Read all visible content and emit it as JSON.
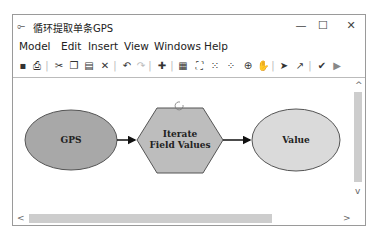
{
  "window": {
    "title": "循环提取单条GPS",
    "controls": {
      "minimize": "—",
      "maximize": "☐",
      "close": "✕"
    }
  },
  "menu": [
    "Model",
    "Edit",
    "Insert",
    "View",
    "Windows",
    "Help"
  ],
  "toolbar": [
    {
      "icon": "save-icon",
      "glyph": "▪"
    },
    {
      "icon": "print-icon",
      "glyph": "⎙"
    },
    {
      "icon": "cut-icon",
      "glyph": "✂"
    },
    {
      "icon": "copy-icon",
      "glyph": "❐"
    },
    {
      "icon": "paste-icon",
      "glyph": "▤"
    },
    {
      "icon": "delete-icon",
      "glyph": "✕"
    },
    {
      "icon": "undo-icon",
      "glyph": "↶"
    },
    {
      "icon": "redo-icon",
      "glyph": "↷"
    },
    {
      "icon": "add-data-icon",
      "glyph": "✚"
    },
    {
      "icon": "auto-layout-icon",
      "glyph": "▦"
    },
    {
      "icon": "full-extent-icon",
      "glyph": "⛶"
    },
    {
      "icon": "zoom-in-fixed-icon",
      "glyph": "⁙"
    },
    {
      "icon": "zoom-out-fixed-icon",
      "glyph": "⁘"
    },
    {
      "icon": "zoom-in-icon",
      "glyph": "⊕"
    },
    {
      "icon": "pan-icon",
      "glyph": "✋"
    },
    {
      "icon": "select-icon",
      "glyph": "➤"
    },
    {
      "icon": "connect-icon",
      "glyph": "↗"
    },
    {
      "icon": "validate-icon",
      "glyph": "✔"
    },
    {
      "icon": "run-icon",
      "glyph": "▶"
    }
  ],
  "diagram": {
    "nodes": [
      {
        "id": "gps",
        "label": "GPS",
        "shape": "ellipse",
        "fill": "#a8a8a8"
      },
      {
        "id": "iterate",
        "label_line1": "Iterate",
        "label_line2": "Field Values",
        "shape": "hexagon",
        "fill": "#bdbdbd"
      },
      {
        "id": "value",
        "label": "Value",
        "shape": "ellipse",
        "fill": "#d9d9d9"
      }
    ]
  },
  "scroll": {
    "up": "^",
    "down": "v",
    "left": "<",
    "right": ">"
  }
}
